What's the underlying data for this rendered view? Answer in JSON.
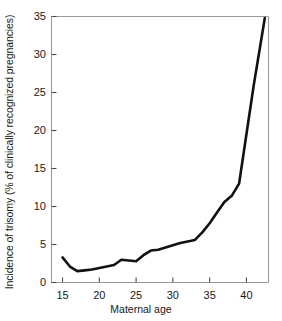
{
  "chart_data": {
    "type": "line",
    "title": "",
    "xlabel": "Maternal age",
    "ylabel": "Incidence of trisomy (% of clinically recognized pregnancies)",
    "xlim": [
      13.5,
      43.0
    ],
    "ylim": [
      0,
      35
    ],
    "xticks": [
      15,
      20,
      25,
      30,
      35,
      40
    ],
    "yticks": [
      0,
      5,
      10,
      15,
      20,
      25,
      30,
      35
    ],
    "xtick_labels": [
      "15",
      "20",
      "25",
      "30",
      "35",
      "40"
    ],
    "ytick_labels": [
      "0",
      "5",
      "10",
      "15",
      "20",
      "25",
      "30",
      "35"
    ],
    "grid": false,
    "legend": "none",
    "series": [
      {
        "name": "Incidence of trisomy",
        "color": "#111111",
        "line_width": 2.6,
        "x": [
          15,
          16,
          17,
          18,
          19,
          20,
          21,
          22,
          23,
          24,
          25,
          26,
          27,
          28,
          29,
          30,
          31,
          32,
          33,
          34,
          35,
          36,
          37,
          38,
          39,
          40,
          41,
          42.5
        ],
        "values": [
          3.3,
          2.1,
          1.5,
          1.6,
          1.7,
          1.9,
          2.1,
          2.3,
          3.0,
          2.9,
          2.8,
          3.6,
          4.2,
          4.3,
          4.6,
          4.9,
          5.2,
          5.4,
          5.6,
          6.6,
          7.8,
          9.2,
          10.6,
          11.4,
          13.0,
          19.5,
          26.0,
          34.8
        ]
      }
    ],
    "annotations": []
  },
  "axes": {
    "frame_color": "#9a9a9a",
    "tick_color": "#4d4d4d",
    "background": "#ffffff"
  }
}
